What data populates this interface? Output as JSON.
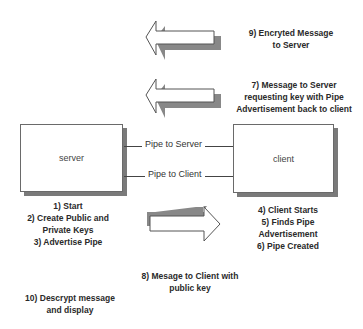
{
  "nodes": {
    "server": {
      "label": "server"
    },
    "client": {
      "label": "client"
    }
  },
  "pipes": [
    {
      "label": "Pipe to Server"
    },
    {
      "label": "Pipe to Client"
    }
  ],
  "arrows": [
    {
      "direction": "left",
      "label_lines": [
        "9) Encryted Message",
        "to Server"
      ]
    },
    {
      "direction": "left",
      "label_lines": [
        "7) Message to Server",
        "requesting key with Pipe",
        "Advertisement back to client"
      ]
    },
    {
      "direction": "right",
      "label_lines": [
        "8) Mesage to Client with",
        "public key"
      ]
    }
  ],
  "server_steps": [
    "1) Start",
    "2) Create Public and",
    "Private Keys",
    "3) Advertise Pipe"
  ],
  "client_steps": [
    "4) Client Starts",
    "5) Finds Pipe",
    "Advertisement",
    "6) Pipe Created"
  ],
  "final_step": [
    "10) Descrypt message",
    "and display"
  ],
  "colors": {
    "line": "#444444",
    "shadow": "#7a7a7a",
    "background": "#ffffff"
  }
}
